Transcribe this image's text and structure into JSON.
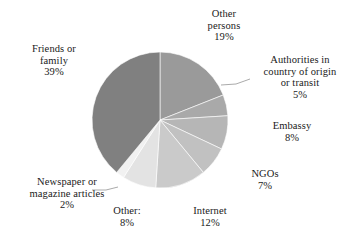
{
  "chart_data": {
    "type": "pie",
    "title": "",
    "subtitle": "",
    "xlabel": "",
    "ylabel": "",
    "grid": false,
    "legend": "none",
    "label_format": "name + percent",
    "start_angle_deg": 0,
    "direction": "clockwise",
    "categories": [
      "Other persons",
      "Authorities in country of origin or transit",
      "Embassy",
      "NGOs",
      "Internet",
      "Other:",
      "Newspaper or magazine articles",
      "Friends or family"
    ],
    "values": [
      19,
      5,
      8,
      7,
      12,
      8,
      2,
      39
    ],
    "unit": "%",
    "slices": [
      {
        "label": "Other persons",
        "value": 19,
        "percent_text": "19%",
        "color": "#9a9a9a",
        "leader_line": false
      },
      {
        "label": "Authorities in country of origin or transit",
        "value": 5,
        "percent_text": "5%",
        "color": "#a9a9a9",
        "leader_line": true
      },
      {
        "label": "Embassy",
        "value": 8,
        "percent_text": "8%",
        "color": "#b6b6b6",
        "leader_line": false
      },
      {
        "label": "NGOs",
        "value": 7,
        "percent_text": "7%",
        "color": "#c1c1c1",
        "leader_line": false
      },
      {
        "label": "Internet",
        "value": 12,
        "percent_text": "12%",
        "color": "#cacaca",
        "leader_line": false
      },
      {
        "label": "Other:",
        "value": 8,
        "percent_text": "8%",
        "color": "#e3e3e3",
        "leader_line": false
      },
      {
        "label": "Newspaper or magazine articles",
        "value": 2,
        "percent_text": "2%",
        "color": "#f1f1f1",
        "leader_line": true
      },
      {
        "label": "Friends or family",
        "value": 39,
        "percent_text": "39%",
        "color": "#808080",
        "leader_line": false
      }
    ]
  },
  "labels": {
    "other_persons": {
      "line1": "Other",
      "line2": "persons",
      "pct": "19%"
    },
    "authorities": {
      "line1": "Authorities in",
      "line2": "country of origin",
      "line3": "or transit",
      "pct": "5%"
    },
    "embassy": {
      "line1": "Embassy",
      "pct": "8%"
    },
    "ngos": {
      "line1": "NGOs",
      "pct": "7%"
    },
    "internet": {
      "line1": "Internet",
      "pct": "12%"
    },
    "other": {
      "line1": "Other:",
      "pct": "8%"
    },
    "newspaper": {
      "line1": "Newspaper or",
      "line2": "magazine articles",
      "pct": "2%"
    },
    "friends": {
      "line1": "Friends or",
      "line2": "family",
      "pct": "39%"
    }
  },
  "colors": {
    "background": "#ffffff",
    "text": "#1a1a1a",
    "leader_line": "#9a9a9a"
  }
}
